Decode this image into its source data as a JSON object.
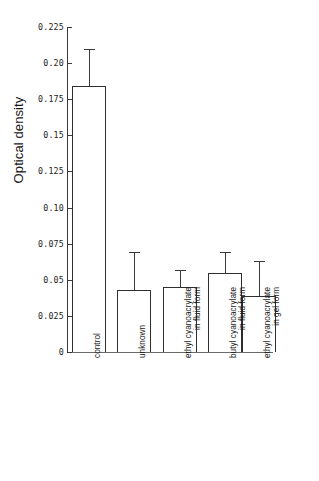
{
  "chart_data": {
    "type": "bar",
    "title": "",
    "xlabel": "",
    "ylabel": "Optical density",
    "ylim": [
      0,
      0.225
    ],
    "grid": false,
    "legend": "none",
    "error_bars": "upper only (SD)",
    "ytick_values": [
      0,
      0.025,
      0.05,
      0.075,
      0.1,
      0.125,
      0.15,
      0.175,
      0.2,
      0.225
    ],
    "ytick_labels": [
      "0",
      "0.025",
      "0.05",
      "0.075",
      "0.10",
      "0.125",
      "0.15",
      "0.175",
      "0.20",
      "0.225"
    ],
    "categories": [
      "control",
      "unknown",
      "ethyl cyanoacrylate in fluid form",
      "butyl cyanoacrylate in fluid form",
      "ethyl cyanoacrylate in gel form"
    ],
    "category_lines": [
      [
        "control",
        ""
      ],
      [
        "unknown",
        ""
      ],
      [
        "ethyl cyanoacrylate",
        "in fluid form"
      ],
      [
        "butyl cyanoacrylate",
        "in fluid form"
      ],
      [
        "ethyl cyanoacrylate",
        "in gel form"
      ]
    ],
    "values": [
      0.184,
      0.043,
      0.045,
      0.055,
      0.039
    ],
    "error_upper": [
      0.21,
      0.069,
      0.057,
      0.069,
      0.063
    ],
    "colors": {
      "bar_fill": "#ffffff",
      "bar_edge": "#2e2e2e",
      "axis": "#3a3a3a",
      "text": "#181818",
      "background": "#ffffff"
    }
  }
}
